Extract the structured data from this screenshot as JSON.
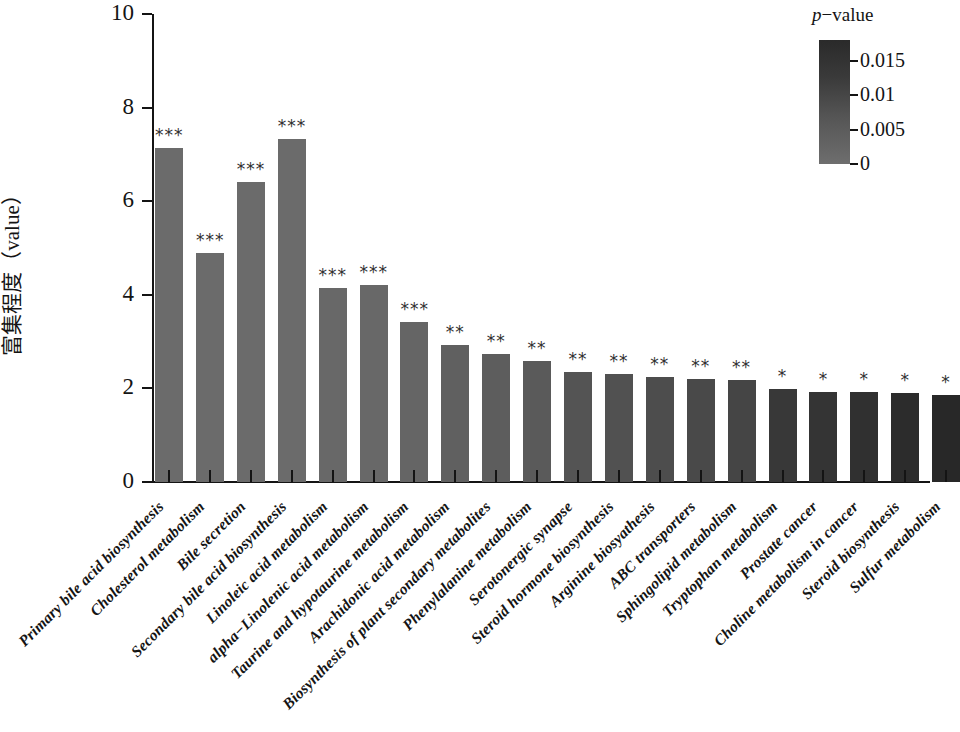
{
  "chart_data": {
    "type": "bar",
    "title": "",
    "xlabel": "",
    "ylabel": "富集程度（value）",
    "ylim": [
      0,
      10
    ],
    "ytick_values": [
      0,
      2,
      4,
      6,
      8,
      10
    ],
    "ytick_labels": [
      "0",
      "2",
      "4",
      "6",
      "8",
      "10"
    ],
    "grid": false,
    "legend_position": "top-right",
    "categories": [
      "Primary bile acid biosynthesis",
      "Cholesterol metabolism",
      "Bile secretion",
      "Secondary bile acid biosynthesis",
      "Linoleic acid metabolism",
      "alpha−Linolenic acid metabolism",
      "Taurine and hypotaurine metabolism",
      "Arachidonic acid metabolism",
      "Biosynthesis of plant secondary metabolites",
      "Phenylalanine metabolism",
      "Serotonergic synapse",
      "Steroid hormone biosynthesis",
      "Arginine biosyathesis",
      "ABC transporters",
      "Sphingolipid metabolism",
      "Tryptophan metabolism",
      "Prostate cancer",
      "Choline metabolism in cancer",
      "Steroid biosynthesis",
      "Sulfur metabolism"
    ],
    "values": [
      7.14,
      4.9,
      6.4,
      7.32,
      4.15,
      4.2,
      3.42,
      2.92,
      2.73,
      2.58,
      2.36,
      2.3,
      2.25,
      2.2,
      2.17,
      1.98,
      1.93,
      1.92,
      1.9,
      1.85
    ],
    "significance": [
      "***",
      "***",
      "***",
      "***",
      "***",
      "***",
      "***",
      "**",
      "**",
      "**",
      "**",
      "**",
      "**",
      "**",
      "**",
      "*",
      "*",
      "*",
      "*",
      "*"
    ],
    "bar_colors": [
      "#6b6b6b",
      "#6b6b6b",
      "#6b6b6b",
      "#6b6b6b",
      "#686868",
      "#686868",
      "#656565",
      "#606060",
      "#5d5d5d",
      "#5a5a5a",
      "#545454",
      "#515151",
      "#4d4d4d",
      "#494949",
      "#454545",
      "#383838",
      "#343434",
      "#303030",
      "#2c2c2c",
      "#282828"
    ]
  },
  "legend": {
    "title_italic": "p",
    "title_rest": "−value",
    "ticks": [
      "0.015",
      "0.01",
      "0.005",
      "0"
    ],
    "tick_values": [
      0.015,
      0.01,
      0.005,
      0
    ],
    "gradient_top_color": "#2a2a2a",
    "gradient_bottom_color": "#6e6e6e",
    "scale_max": 0.018
  }
}
